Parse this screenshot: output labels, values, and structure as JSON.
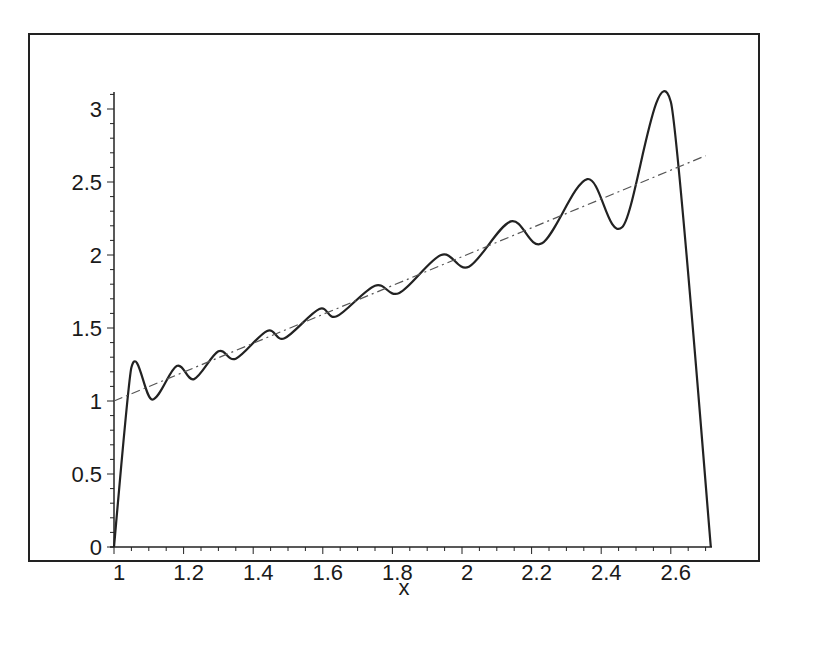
{
  "chart_data": {
    "type": "line",
    "title": "",
    "xlabel": "x",
    "ylabel": "",
    "xlim": [
      1,
      2.72
    ],
    "ylim": [
      0,
      3.1
    ],
    "grid": false,
    "legend": null,
    "x_ticks": [
      "1",
      "1.2",
      "1.4",
      "1.6",
      "1.8",
      "2",
      "2.2",
      "2.4",
      "2.6"
    ],
    "y_ticks": [
      "0",
      "0.5",
      "1",
      "1.5",
      "2",
      "2.5",
      "3"
    ],
    "series": [
      {
        "name": "approximation",
        "style": "solid",
        "x": [
          1.0,
          1.05,
          1.11,
          1.18,
          1.23,
          1.3,
          1.35,
          1.44,
          1.49,
          1.59,
          1.64,
          1.75,
          1.82,
          1.94,
          2.02,
          2.14,
          2.23,
          2.36,
          2.46,
          2.6,
          2.715
        ],
        "y": [
          0.0,
          1.23,
          1.01,
          1.24,
          1.15,
          1.34,
          1.29,
          1.48,
          1.43,
          1.63,
          1.58,
          1.79,
          1.74,
          2.0,
          1.92,
          2.23,
          2.08,
          2.52,
          2.19,
          3.05,
          0.0
        ]
      },
      {
        "name": "y = x",
        "style": "dash-dot",
        "x": [
          1.0,
          2.7
        ],
        "y": [
          1.0,
          2.68
        ]
      }
    ]
  },
  "colors": {
    "line": "#222222",
    "axis": "#222222",
    "frame": "#222222",
    "background": "#ffffff"
  }
}
